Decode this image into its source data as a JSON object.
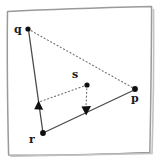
{
  "figure": {
    "background_color": "#ffffff",
    "ink_color": "#3c3c3c",
    "point_color": "#101010",
    "label_color": "#1a1a1a",
    "frame": {
      "name": "hand-drawn-square-border",
      "stroke": "#8c8c8c",
      "corners": [
        {
          "x": 7,
          "y": 10
        },
        {
          "x": 152,
          "y": 6
        },
        {
          "x": 150,
          "y": 153
        },
        {
          "x": 9,
          "y": 156
        }
      ]
    },
    "points": [
      {
        "id": "q",
        "label": "q",
        "x": 28,
        "y": 29
      },
      {
        "id": "s",
        "label": "s",
        "x": 87,
        "y": 85
      },
      {
        "id": "p",
        "label": "p",
        "x": 135,
        "y": 89
      },
      {
        "id": "r",
        "label": "r",
        "x": 43,
        "y": 133
      }
    ],
    "arrowheads": [
      {
        "id": "arrow-up-on-rq",
        "x": 38,
        "y": 106,
        "direction": "up"
      },
      {
        "id": "arrow-down-on-rp",
        "x": 86,
        "y": 111,
        "direction": "down"
      }
    ],
    "solid_edges": [
      {
        "id": "edge-r-q",
        "from": "r",
        "to": "q"
      },
      {
        "id": "edge-r-p",
        "from": "r",
        "to": "p"
      }
    ],
    "dotted_edges": [
      {
        "id": "edge-q-p",
        "from": "q",
        "to": "p"
      },
      {
        "id": "edge-s-arrow-up",
        "from": "s",
        "to": "arrow-up-on-rq"
      },
      {
        "id": "edge-s-arrow-down",
        "from": "s",
        "to": "arrow-down-on-rp"
      }
    ]
  },
  "labels": {
    "q": "q",
    "p": "p",
    "r": "r",
    "s": "s"
  }
}
